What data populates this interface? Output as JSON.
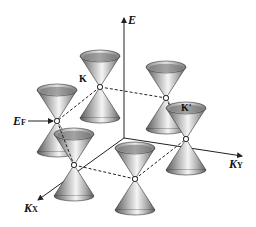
{
  "diagram": {
    "axes": {
      "energy": {
        "label": "E"
      },
      "kx": {
        "label_main": "K",
        "label_sub": "X"
      },
      "ky": {
        "label_main": "K",
        "label_sub": "Y"
      }
    },
    "points": {
      "k": {
        "label": "K"
      },
      "k_prime": {
        "label": "K'"
      }
    },
    "fermi_level": {
      "label_main": "E",
      "label_sub": "F"
    },
    "cones": [
      {
        "name": "cone-k",
        "x": 100,
        "y": 87
      },
      {
        "name": "cone-k-prime",
        "x": 166,
        "y": 98
      },
      {
        "name": "cone-left",
        "x": 57,
        "y": 121
      },
      {
        "name": "cone-right",
        "x": 186,
        "y": 139
      },
      {
        "name": "cone-front-left",
        "x": 74,
        "y": 165
      },
      {
        "name": "cone-front-bottom",
        "x": 135,
        "y": 179
      }
    ],
    "colors": {
      "line": "#222222",
      "cone_dark": "#6a6a6a",
      "cone_light": "#f2f2f2"
    }
  }
}
